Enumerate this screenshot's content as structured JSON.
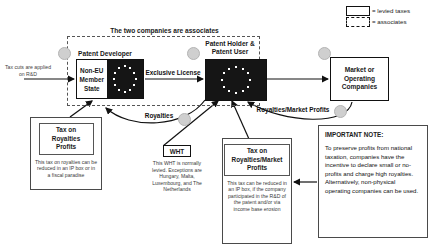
{
  "diagram": {
    "legend": {
      "items": [
        {
          "icon": "solid-rectangle-icon",
          "label": "= levied taxes"
        },
        {
          "icon": "dashed-rectangle-icon",
          "label": "= associates"
        }
      ]
    },
    "assoc_frame_caption": "The two companies are associates",
    "nodes": {
      "patent_developer": {
        "caption": "Patent Developer",
        "state_line1": "Non-EU",
        "state_line2": "Member",
        "state_line3": "State",
        "flag": "eu-flag-icon"
      },
      "patent_holder": {
        "caption_line1": "Patent Holder &",
        "caption_line2": "Patent User",
        "flag": "eu-flag-icon"
      },
      "market": {
        "line1": "Market or",
        "line2": "Operating",
        "line3": "Companies"
      }
    },
    "edge_labels": {
      "tax_cuts": "Tax cuts are applied on R&D",
      "exclusive_license": "Exclusive License",
      "royalties": "Royalties",
      "royalties_market_profits": "Royalties/Market Profits"
    },
    "panels": {
      "tax_royalties": {
        "title_line1": "Tax on",
        "title_line2": "Royalties",
        "title_line3": "Profits",
        "body": "This tax on royalties can be reduced in an IP box or in a fiscal paradise"
      },
      "wht": {
        "title": "WHT",
        "body": "This WHT is normally levied. Exceptions are Hungary, Malta, Luxembourg, and The Netherlands"
      },
      "tax_royalties_market": {
        "title_line1": "Tax on",
        "title_line2": "Royalties/Market",
        "title_line3": "Profits",
        "body": "This tax can be reduced in an IP box, if the company participated in the R&D of the patent and/or via income base erosion"
      },
      "important_note": {
        "title": "IMPORTANT NOTE:",
        "body": "To preserve profits from national taxation, companies have the incentive to declare small or no-profits and charge high royalties. Alternatively, non-physical operating companies can be used."
      }
    },
    "colors": {
      "flag_fill": "#151515",
      "star": "#ffffff",
      "line": "#111111",
      "badge": "#cfcfcf"
    }
  }
}
